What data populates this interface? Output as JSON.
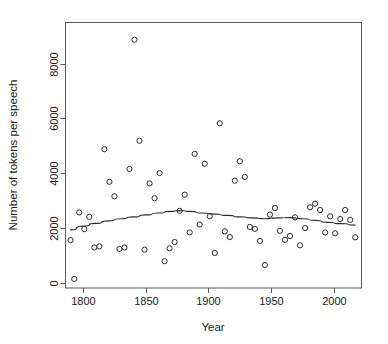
{
  "chart_data": {
    "type": "scatter",
    "title": "",
    "subtitle": "",
    "xlabel": "Year",
    "ylabel": "Number of tokens per speech",
    "xlim": [
      1786,
      2022
    ],
    "ylim": [
      -200,
      9500
    ],
    "xticks": [
      1800,
      1850,
      1900,
      1950,
      2000
    ],
    "xtick_labels": [
      "1800",
      "1850",
      "1900",
      "1950",
      "2000"
    ],
    "yticks": [
      0,
      2000,
      4000,
      6000,
      8000
    ],
    "ytick_labels": [
      "0",
      "2000",
      "4000",
      "6000",
      "8000"
    ],
    "grid": false,
    "legend": null,
    "marker": "open-circle",
    "marker_color": "#2b2b2b",
    "annotations": [],
    "x": [
      1790,
      1793,
      1797,
      1801,
      1805,
      1809,
      1813,
      1817,
      1821,
      1825,
      1829,
      1833,
      1837,
      1841,
      1845,
      1849,
      1853,
      1857,
      1861,
      1865,
      1869,
      1873,
      1877,
      1881,
      1885,
      1889,
      1893,
      1897,
      1901,
      1905,
      1909,
      1913,
      1917,
      1921,
      1925,
      1929,
      1933,
      1937,
      1941,
      1945,
      1949,
      1953,
      1957,
      1961,
      1965,
      1969,
      1973,
      1977,
      1981,
      1985,
      1989,
      1993,
      1997,
      2001,
      2005,
      2009,
      2013,
      2017
    ],
    "y": [
      1550,
      130,
      2560,
      1950,
      2400,
      1280,
      1320,
      4870,
      3680,
      3150,
      1230,
      1280,
      4150,
      8870,
      5180,
      1200,
      3620,
      3080,
      4000,
      780,
      1250,
      1480,
      2620,
      3210,
      1830,
      4700,
      2120,
      4340,
      2420,
      1080,
      5820,
      1870,
      1660,
      3720,
      4430,
      3860,
      2030,
      1960,
      1520,
      640,
      2480,
      2720,
      1890,
      1560,
      1700,
      2380,
      1360,
      1990,
      2750,
      2880,
      2650,
      1830,
      2420,
      1800,
      2320,
      2650,
      2290,
      1650
    ],
    "series": [
      {
        "name": "tokens per speech",
        "type": "scatter",
        "marker": "open-circle",
        "color": "#2b2b2b"
      },
      {
        "name": "smoothed trend",
        "type": "line",
        "color": "#2b2b2b",
        "x": [
          1790,
          1800,
          1810,
          1820,
          1830,
          1840,
          1850,
          1860,
          1870,
          1877,
          1885,
          1895,
          1905,
          1915,
          1925,
          1935,
          1945,
          1955,
          1965,
          1975,
          1985,
          1995,
          2005,
          2017
        ],
        "y": [
          1920,
          2060,
          2160,
          2250,
          2330,
          2400,
          2470,
          2540,
          2600,
          2630,
          2600,
          2540,
          2500,
          2450,
          2400,
          2360,
          2330,
          2360,
          2370,
          2330,
          2270,
          2200,
          2150,
          2100
        ]
      }
    ]
  },
  "axes": {
    "x_title": "Year",
    "y_title": "Number of tokens per speech"
  }
}
